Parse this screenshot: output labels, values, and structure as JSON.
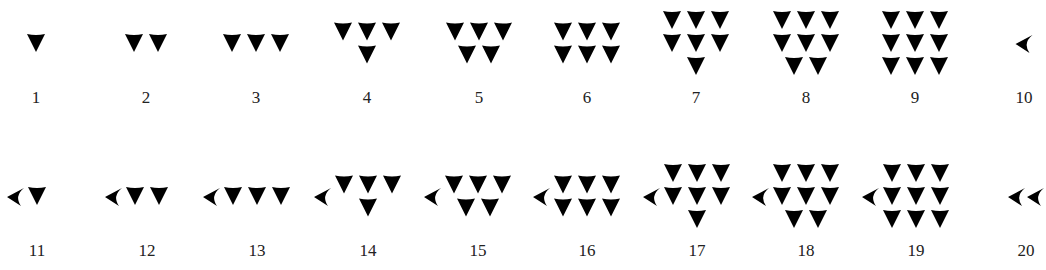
{
  "colors": {
    "glyph": "#000000",
    "label": "#222222",
    "background": "#ffffff"
  },
  "glyph_names": {
    "unit": "vertical-wedge-icon",
    "ten": "corner-wedge-icon"
  },
  "rows": [
    {
      "glyph_center_y": 43,
      "label_top_y": 89,
      "numerals": [
        {
          "value": 1,
          "label": "1",
          "center_x": 36,
          "tens": 0,
          "units": 1
        },
        {
          "value": 2,
          "label": "2",
          "center_x": 146,
          "tens": 0,
          "units": 2
        },
        {
          "value": 3,
          "label": "3",
          "center_x": 256,
          "tens": 0,
          "units": 3
        },
        {
          "value": 4,
          "label": "4",
          "center_x": 367,
          "tens": 0,
          "units": 4
        },
        {
          "value": 5,
          "label": "5",
          "center_x": 479,
          "tens": 0,
          "units": 5
        },
        {
          "value": 6,
          "label": "6",
          "center_x": 587,
          "tens": 0,
          "units": 6
        },
        {
          "value": 7,
          "label": "7",
          "center_x": 696,
          "tens": 0,
          "units": 7
        },
        {
          "value": 8,
          "label": "8",
          "center_x": 806,
          "tens": 0,
          "units": 8
        },
        {
          "value": 9,
          "label": "9",
          "center_x": 915,
          "tens": 0,
          "units": 9
        },
        {
          "value": 10,
          "label": "10",
          "center_x": 1024,
          "tens": 1,
          "units": 0
        }
      ]
    },
    {
      "glyph_center_y": 196,
      "label_top_y": 242,
      "numerals": [
        {
          "value": 11,
          "label": "11",
          "center_x": 37,
          "tens": 1,
          "units": 1
        },
        {
          "value": 12,
          "label": "12",
          "center_x": 147,
          "tens": 1,
          "units": 2
        },
        {
          "value": 13,
          "label": "13",
          "center_x": 257,
          "tens": 1,
          "units": 3
        },
        {
          "value": 14,
          "label": "14",
          "center_x": 368,
          "tens": 1,
          "units": 4
        },
        {
          "value": 15,
          "label": "15",
          "center_x": 478,
          "tens": 1,
          "units": 5
        },
        {
          "value": 16,
          "label": "16",
          "center_x": 587,
          "tens": 1,
          "units": 6
        },
        {
          "value": 17,
          "label": "17",
          "center_x": 697,
          "tens": 1,
          "units": 7
        },
        {
          "value": 18,
          "label": "18",
          "center_x": 806,
          "tens": 1,
          "units": 8
        },
        {
          "value": 19,
          "label": "19",
          "center_x": 916,
          "tens": 1,
          "units": 9
        },
        {
          "value": 20,
          "label": "20",
          "center_x": 1026,
          "tens": 2,
          "units": 0
        }
      ]
    }
  ],
  "unit_layouts": {
    "1": [
      1
    ],
    "2": [
      2
    ],
    "3": [
      3
    ],
    "4": [
      3,
      1
    ],
    "5": [
      3,
      2
    ],
    "6": [
      3,
      3
    ],
    "7": [
      3,
      3,
      1
    ],
    "8": [
      3,
      3,
      2
    ],
    "9": [
      3,
      3,
      3
    ]
  }
}
